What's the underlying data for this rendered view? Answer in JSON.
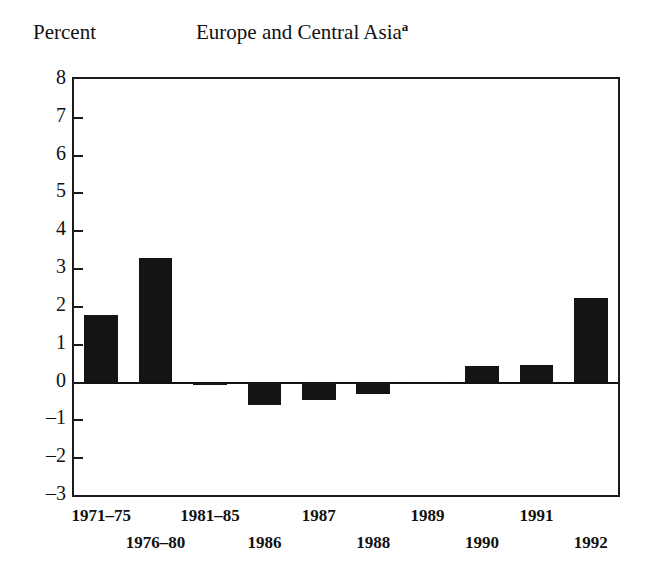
{
  "chart_data": {
    "type": "bar",
    "title": "Europe and Central Asia",
    "title_superscript": "a",
    "ylabel": "Percent",
    "xlabel": "",
    "ylim": [
      -3,
      8
    ],
    "ytick_labels": [
      "8",
      "7",
      "6",
      "5",
      "4",
      "3",
      "2",
      "1",
      "0",
      "-1",
      "-2",
      "-3"
    ],
    "ytick_values": [
      8,
      7,
      6,
      5,
      4,
      3,
      2,
      1,
      0,
      -1,
      -2,
      -3
    ],
    "grid": false,
    "legend": "none",
    "categories": [
      "1971-75",
      "1976-80",
      "1981-85",
      "1986",
      "1987",
      "1988",
      "1989",
      "1990",
      "1991",
      "1992"
    ],
    "category_display": [
      "1971–75",
      "1976–80",
      "1981–85",
      "1986",
      "1987",
      "1988",
      "1989",
      "1990",
      "1991",
      "1992"
    ],
    "values": [
      1.75,
      3.27,
      -0.08,
      -0.62,
      -0.49,
      -0.32,
      -0.05,
      0.42,
      0.45,
      2.2
    ],
    "bar_color": "#141414",
    "axis_color": "#1a1a1a"
  },
  "axes": {
    "y_label_text": "Percent",
    "ticks": [
      {
        "label": "8",
        "value": 8
      },
      {
        "label": "7",
        "value": 7
      },
      {
        "label": "6",
        "value": 6
      },
      {
        "label": "5",
        "value": 5
      },
      {
        "label": "4",
        "value": 4
      },
      {
        "label": "3",
        "value": 3
      },
      {
        "label": "2",
        "value": 2
      },
      {
        "label": "1",
        "value": 1
      },
      {
        "label": "0",
        "value": 0
      },
      {
        "label": "–1",
        "value": -1
      },
      {
        "label": "–2",
        "value": -2
      },
      {
        "label": "–3",
        "value": -3
      }
    ]
  },
  "x_axis": {
    "entries": [
      {
        "label": "1971–75",
        "row": "top"
      },
      {
        "label": "1976–80",
        "row": "bot"
      },
      {
        "label": "1981–85",
        "row": "top"
      },
      {
        "label": "1986",
        "row": "bot"
      },
      {
        "label": "1987",
        "row": "top"
      },
      {
        "label": "1988",
        "row": "bot"
      },
      {
        "label": "1989",
        "row": "top"
      },
      {
        "label": "1990",
        "row": "bot"
      },
      {
        "label": "1991",
        "row": "top"
      },
      {
        "label": "1992",
        "row": "bot"
      }
    ]
  },
  "title": {
    "main": "Europe and Central Asia",
    "superscript": "a"
  }
}
